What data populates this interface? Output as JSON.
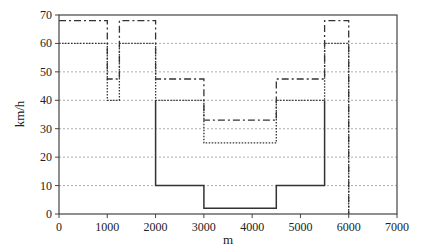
{
  "chart_data": {
    "type": "line",
    "title": "",
    "xlabel": "m",
    "ylabel": "km/h",
    "xlim": [
      0,
      7000
    ],
    "ylim": [
      0,
      70
    ],
    "xticks": [
      0,
      1000,
      2000,
      3000,
      4000,
      5000,
      6000,
      7000
    ],
    "yticks": [
      0,
      10,
      20,
      30,
      40,
      50,
      60,
      70
    ],
    "grid": "horizontal dotted",
    "legend": "none",
    "series": [
      {
        "name": "dash-dot",
        "style": "dashdot",
        "points": [
          [
            0,
            68
          ],
          [
            1000,
            68
          ],
          [
            1000,
            47.5
          ],
          [
            1250,
            47.5
          ],
          [
            1250,
            68
          ],
          [
            2000,
            68
          ],
          [
            2000,
            47.5
          ],
          [
            3000,
            47.5
          ],
          [
            3000,
            33
          ],
          [
            4500,
            33
          ],
          [
            4500,
            47.5
          ],
          [
            5500,
            47.5
          ],
          [
            5500,
            68
          ],
          [
            6000,
            68
          ],
          [
            6000,
            0
          ]
        ]
      },
      {
        "name": "dotted",
        "style": "dotted",
        "points": [
          [
            0,
            60
          ],
          [
            1000,
            60
          ],
          [
            1000,
            40
          ],
          [
            1250,
            40
          ],
          [
            1250,
            60
          ],
          [
            2000,
            60
          ],
          [
            2000,
            40
          ],
          [
            3000,
            40
          ],
          [
            3000,
            25
          ],
          [
            4500,
            25
          ],
          [
            4500,
            40
          ],
          [
            5500,
            40
          ],
          [
            5500,
            60
          ],
          [
            6000,
            60
          ],
          [
            6000,
            0
          ]
        ]
      },
      {
        "name": "solid",
        "style": "solid",
        "points": [
          [
            2000,
            40
          ],
          [
            2000,
            10
          ],
          [
            3000,
            10
          ],
          [
            3000,
            2
          ],
          [
            4500,
            2
          ],
          [
            4500,
            10
          ],
          [
            5500,
            10
          ],
          [
            5500,
            40
          ]
        ]
      }
    ]
  }
}
